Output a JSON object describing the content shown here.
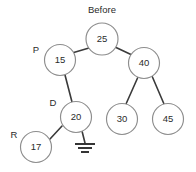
{
  "diagram": {
    "title": "Before",
    "type": "binary-search-tree",
    "title_position": {
      "x": 102,
      "y": 10
    },
    "node_radius": 15.5,
    "root_radius": 16,
    "colors": {
      "background": "#ffffff",
      "node_stroke": "#8d8d8d",
      "node_fill": "#ffffff",
      "edge_stroke": "#3a3a3a",
      "text": "#2b2b2b",
      "ground_stroke": "#2b2b2b"
    },
    "nodes": [
      {
        "id": "n25",
        "value": "25",
        "x": 102,
        "y": 39,
        "r": 16
      },
      {
        "id": "n15",
        "value": "15",
        "x": 60,
        "y": 60,
        "r": 15.5
      },
      {
        "id": "n40",
        "value": "40",
        "x": 144,
        "y": 63,
        "r": 15.5
      },
      {
        "id": "n20",
        "value": "20",
        "x": 76,
        "y": 117,
        "r": 15.5
      },
      {
        "id": "n30",
        "value": "30",
        "x": 122,
        "y": 119,
        "r": 15.5
      },
      {
        "id": "n45",
        "value": "45",
        "x": 168,
        "y": 119,
        "r": 15.5
      },
      {
        "id": "n17",
        "value": "17",
        "x": 36,
        "y": 147,
        "r": 15.5
      }
    ],
    "edges": [
      {
        "id": "e25-15",
        "from": "n25",
        "to": "n15",
        "x1": 89,
        "y1": 48,
        "x2": 72,
        "y2": 53
      },
      {
        "id": "e25-40",
        "from": "n25",
        "to": "n40",
        "x1": 115,
        "y1": 47,
        "x2": 132,
        "y2": 55
      },
      {
        "id": "e15-20",
        "from": "n15",
        "to": "n20",
        "x1": 65,
        "y1": 75,
        "x2": 72,
        "y2": 102
      },
      {
        "id": "e40-30",
        "from": "n40",
        "to": "n30",
        "x1": 138,
        "y1": 77,
        "x2": 126,
        "y2": 104
      },
      {
        "id": "e40-45",
        "from": "n40",
        "to": "n45",
        "x1": 152,
        "y1": 76,
        "x2": 164,
        "y2": 104
      },
      {
        "id": "e20-17",
        "from": "n20",
        "to": "n17",
        "x1": 62,
        "y1": 126,
        "x2": 50,
        "y2": 139
      },
      {
        "id": "e20-null",
        "from": "n20",
        "to": "ground",
        "x1": 82,
        "y1": 131,
        "x2": 85,
        "y2": 143
      }
    ],
    "pointer_labels": [
      {
        "id": "label-p",
        "text": "P",
        "target": "n15",
        "x": 36,
        "y": 50
      },
      {
        "id": "label-d",
        "text": "D",
        "target": "n20",
        "x": 53,
        "y": 103
      },
      {
        "id": "label-r",
        "text": "R",
        "target": "n17",
        "x": 14,
        "y": 135
      }
    ],
    "null_pointer": {
      "id": "ground-symbol",
      "meaning": "null",
      "x": 85,
      "y": 143,
      "bars": [
        {
          "y": 144,
          "half_width": 10
        },
        {
          "y": 148,
          "half_width": 7
        },
        {
          "y": 152,
          "half_width": 4
        }
      ]
    }
  }
}
